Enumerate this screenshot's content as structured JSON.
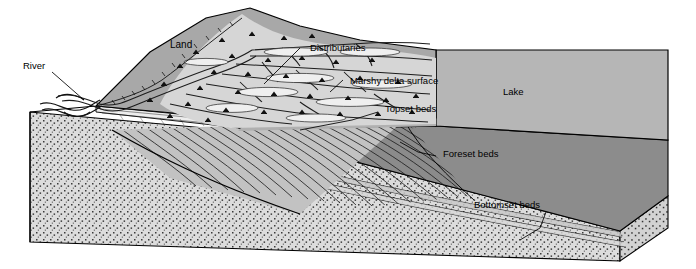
{
  "figure": {
    "type": "block-diagram",
    "width": 696,
    "height": 269,
    "background": "#ffffff"
  },
  "labels": {
    "river": "River",
    "land": "Land",
    "distributaries": "Distributaries",
    "marshy_delta_surface": "Marshy delta surface",
    "topset_beds": "Topset beds",
    "lake": "Lake",
    "foreset_beds": "Foreset beds",
    "bottomset_beds": "Bottomset beds"
  },
  "colors": {
    "land_surface": "#a8a8a8",
    "lake_surface": "#b6b6b6",
    "delta_plain": "#cfcfcf",
    "front_face_stipple_base": "#d8d8d8",
    "foreset_face": "#8c8c8c",
    "block_side_dark": "#7e7e7e",
    "outline": "#000000",
    "label_text": "#000000"
  },
  "features": [
    {
      "name": "land-surface",
      "description": "Upland hill surface at rear left, medium gray"
    },
    {
      "name": "delta-plain",
      "description": "Light gray marshy delta plain with branching distributary channels and marsh tufts"
    },
    {
      "name": "lake-surface",
      "description": "Flat light-medium gray lake water surface filling rear right"
    },
    {
      "name": "topset-beds",
      "description": "Thin horizontal layers capping the delta, at the delta plain margin"
    },
    {
      "name": "foreset-beds",
      "description": "Steeply inclined parallel strata prograding lakeward in cross-section"
    },
    {
      "name": "bottomset-beds",
      "description": "Thin near-horizontal fine layers at the base extending across the lake floor"
    },
    {
      "name": "basement-stipple",
      "description": "Stippled (dotted) sediment/bedrock fill of the block's front and side faces"
    }
  ]
}
